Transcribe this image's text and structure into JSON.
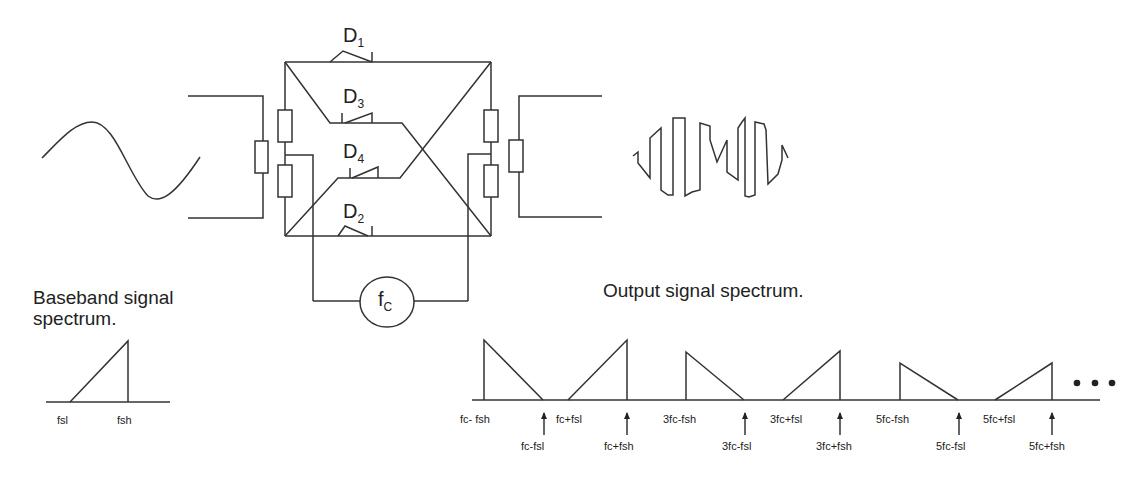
{
  "circuit": {
    "diodes": [
      {
        "name": "D",
        "sub": "1"
      },
      {
        "name": "D",
        "sub": "3"
      },
      {
        "name": "D",
        "sub": "4"
      },
      {
        "name": "D",
        "sub": "2"
      }
    ],
    "oscillator": {
      "name": "f",
      "sub": "C"
    }
  },
  "baseband": {
    "title_line1": "Baseband signal",
    "title_line2": "spectrum.",
    "ticks": [
      "fsl",
      "fsh"
    ]
  },
  "output": {
    "title": "Output signal spectrum.",
    "upper_ticks": [
      "fc- fsh",
      "fc+fsl",
      "3fc-fsh",
      "3fc+fsl",
      "5fc-fsh",
      "5fc+fsl"
    ],
    "lower_ticks": [
      "fc-fsl",
      "fc+fsh",
      "3fc-fsl",
      "3fc+fsh",
      "5fc-fsl",
      "5fc+fsh"
    ],
    "ellipsis": "• • •"
  },
  "colors": {
    "line": "#333333",
    "background": "#ffffff"
  }
}
